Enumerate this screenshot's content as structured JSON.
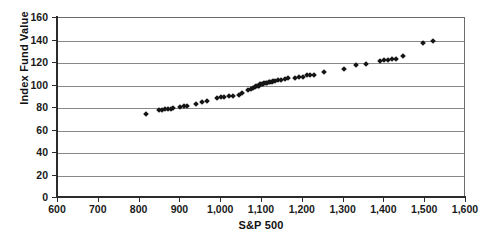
{
  "chart_data": {
    "type": "scatter",
    "title": "",
    "xlabel": "S&P 500",
    "ylabel": "Index Fund Value",
    "xlim": [
      600,
      1600
    ],
    "ylim": [
      0,
      160
    ],
    "xticks": [
      "600",
      "700",
      "800",
      "900",
      "1,000",
      "1,100",
      "1,200",
      "1,300",
      "1,400",
      "1,500",
      "1,600"
    ],
    "xtick_values": [
      600,
      700,
      800,
      900,
      1000,
      1100,
      1200,
      1300,
      1400,
      1500,
      1600
    ],
    "yticks": [
      "0",
      "20",
      "40",
      "60",
      "80",
      "100",
      "120",
      "140",
      "160"
    ],
    "ytick_values": [
      0,
      20,
      40,
      60,
      80,
      100,
      120,
      140,
      160
    ],
    "grid": "horizontal",
    "legend": "none",
    "marker": "diamond",
    "marker_color": "#151515",
    "series": [
      {
        "name": "Index Fund Value vs S&P 500",
        "points": [
          [
            815,
            75
          ],
          [
            848,
            78
          ],
          [
            855,
            78
          ],
          [
            862,
            79
          ],
          [
            869,
            79
          ],
          [
            876,
            79
          ],
          [
            883,
            80
          ],
          [
            900,
            81
          ],
          [
            908,
            82
          ],
          [
            915,
            82
          ],
          [
            938,
            84
          ],
          [
            952,
            85
          ],
          [
            966,
            86
          ],
          [
            990,
            89
          ],
          [
            1000,
            90
          ],
          [
            1008,
            90
          ],
          [
            1020,
            91
          ],
          [
            1030,
            91
          ],
          [
            1044,
            92
          ],
          [
            1052,
            93
          ],
          [
            1066,
            96
          ],
          [
            1073,
            97
          ],
          [
            1078,
            98
          ],
          [
            1083,
            99
          ],
          [
            1086,
            100
          ],
          [
            1090,
            100
          ],
          [
            1093,
            100
          ],
          [
            1096,
            101
          ],
          [
            1100,
            101
          ],
          [
            1103,
            101
          ],
          [
            1106,
            102
          ],
          [
            1110,
            102
          ],
          [
            1113,
            102
          ],
          [
            1116,
            103
          ],
          [
            1120,
            103
          ],
          [
            1124,
            103
          ],
          [
            1128,
            104
          ],
          [
            1132,
            104
          ],
          [
            1140,
            105
          ],
          [
            1147,
            105
          ],
          [
            1157,
            106
          ],
          [
            1164,
            107
          ],
          [
            1181,
            107
          ],
          [
            1190,
            108
          ],
          [
            1200,
            108
          ],
          [
            1210,
            109
          ],
          [
            1218,
            109
          ],
          [
            1227,
            109
          ],
          [
            1252,
            112
          ],
          [
            1300,
            115
          ],
          [
            1330,
            118
          ],
          [
            1355,
            119
          ],
          [
            1390,
            122
          ],
          [
            1400,
            123
          ],
          [
            1408,
            123
          ],
          [
            1418,
            124
          ],
          [
            1428,
            124
          ],
          [
            1445,
            126
          ],
          [
            1495,
            138
          ],
          [
            1518,
            140
          ]
        ]
      }
    ]
  }
}
